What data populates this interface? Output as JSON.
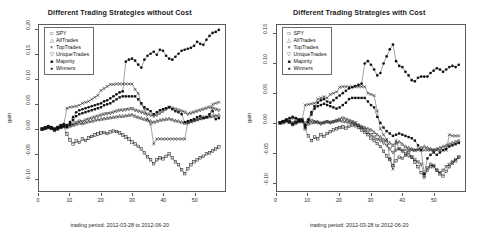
{
  "panels": [
    {
      "id": "without-cost",
      "title": "Different Trading Strategies without Cost",
      "xlabel": "trading period: 2012-03-28 to 2012-06-20",
      "ylabel": "gain"
    },
    {
      "id": "with-cost",
      "title": "Different Trading Strategies with Cost",
      "xlabel": "trading period: 2012-03-28 to 2012-06-20",
      "ylabel": "gain"
    }
  ],
  "legend": {
    "items": [
      {
        "label": "SPY",
        "symbol": "square-open-marker",
        "glyph": "□"
      },
      {
        "label": "AllTrades",
        "symbol": "triangle-up-marker",
        "glyph": "△"
      },
      {
        "label": "TopTrades",
        "symbol": "cross-x-marker",
        "glyph": "×"
      },
      {
        "label": "UniqueTrades",
        "symbol": "triangle-down-marker",
        "glyph": "▽"
      },
      {
        "label": "Majority",
        "symbol": "square-filled-marker",
        "glyph": "■"
      },
      {
        "label": "Winners",
        "symbol": "circle-filled-marker",
        "glyph": "●"
      }
    ]
  },
  "chart_data": [
    {
      "type": "scatter",
      "panel": "without-cost",
      "title": "Different Trading Strategies without Cost",
      "xlabel": "trading period: 2012-03-28 to 2012-06-20",
      "ylabel": "gain",
      "xlim": [
        0,
        60
      ],
      "ylim": [
        -0.125,
        0.21
      ],
      "grid": false,
      "legend_position": "top-left",
      "xticks": [
        0,
        10,
        20,
        30,
        40,
        50
      ],
      "yticks": [
        -0.1,
        -0.05,
        0.0,
        0.05,
        0.1,
        0.15,
        0.2
      ],
      "ytick_labels": [
        "-0.10",
        "-0.05",
        "0.00",
        "0.05",
        "0.10",
        "0.15",
        "0.20"
      ],
      "x": [
        1,
        2,
        3,
        4,
        5,
        6,
        7,
        8,
        9,
        10,
        11,
        12,
        13,
        14,
        15,
        16,
        17,
        18,
        19,
        20,
        21,
        22,
        23,
        24,
        25,
        26,
        27,
        28,
        29,
        30,
        31,
        32,
        33,
        34,
        35,
        36,
        37,
        38,
        39,
        40,
        41,
        42,
        43,
        44,
        45,
        46,
        47,
        48,
        49,
        50,
        51,
        52,
        53,
        54,
        55,
        56,
        57,
        58
      ],
      "series": [
        {
          "name": "SPY",
          "marker": "square-open-marker",
          "values": [
            0.0,
            0.002,
            0.004,
            0.001,
            -0.003,
            0.0,
            0.003,
            0.005,
            -0.01,
            -0.022,
            -0.03,
            -0.024,
            -0.027,
            -0.02,
            -0.023,
            -0.018,
            -0.015,
            -0.012,
            -0.01,
            -0.008,
            -0.007,
            -0.009,
            -0.006,
            -0.004,
            -0.005,
            -0.008,
            -0.012,
            -0.016,
            -0.02,
            -0.026,
            -0.03,
            -0.035,
            -0.04,
            -0.048,
            -0.056,
            -0.062,
            -0.07,
            -0.062,
            -0.058,
            -0.06,
            -0.055,
            -0.05,
            -0.058,
            -0.066,
            -0.072,
            -0.082,
            -0.09,
            -0.08,
            -0.072,
            -0.066,
            -0.062,
            -0.058,
            -0.055,
            -0.05,
            -0.048,
            -0.044,
            -0.04,
            -0.036
          ]
        },
        {
          "name": "AllTrades",
          "marker": "triangle-up-marker",
          "values": [
            0.0,
            0.001,
            0.003,
            0.002,
            0.0,
            0.002,
            0.004,
            0.006,
            0.004,
            0.006,
            0.008,
            0.01,
            0.012,
            0.011,
            0.013,
            0.015,
            0.016,
            0.018,
            0.019,
            0.02,
            0.021,
            0.022,
            0.023,
            0.024,
            0.025,
            0.026,
            0.026,
            0.027,
            0.028,
            0.029,
            0.026,
            0.024,
            0.022,
            0.02,
            0.018,
            0.016,
            0.014,
            0.016,
            0.018,
            0.019,
            0.02,
            0.021,
            0.019,
            0.017,
            0.016,
            0.014,
            0.012,
            0.014,
            0.016,
            0.018,
            0.02,
            0.022,
            0.024,
            0.024,
            0.025,
            0.026,
            0.027,
            0.028
          ]
        },
        {
          "name": "TopTrades",
          "marker": "cross-x-marker",
          "values": [
            0.0,
            0.002,
            0.004,
            0.003,
            0.001,
            0.003,
            0.006,
            0.008,
            0.042,
            0.044,
            0.045,
            0.046,
            0.048,
            0.052,
            0.054,
            0.056,
            0.06,
            0.064,
            0.068,
            0.078,
            0.082,
            0.086,
            0.09,
            0.09,
            0.091,
            0.091,
            0.091,
            0.091,
            0.091,
            0.091,
            0.08,
            0.072,
            0.05,
            0.04,
            0.02,
            0.01,
            -0.03,
            -0.02,
            -0.02,
            -0.02,
            -0.02,
            -0.02,
            -0.02,
            -0.02,
            -0.02,
            -0.02,
            -0.02,
            0.012,
            0.014,
            0.016,
            0.018,
            0.02,
            0.022,
            0.024,
            0.026,
            0.05,
            0.052,
            0.054
          ]
        },
        {
          "name": "UniqueTrades",
          "marker": "triangle-down-marker",
          "values": [
            0.0,
            0.002,
            0.004,
            0.002,
            0.0,
            0.003,
            0.005,
            0.007,
            0.006,
            0.008,
            0.01,
            0.013,
            0.016,
            0.015,
            0.018,
            0.02,
            0.022,
            0.024,
            0.026,
            0.028,
            0.03,
            0.031,
            0.032,
            0.034,
            0.036,
            0.038,
            0.038,
            0.039,
            0.04,
            0.041,
            0.038,
            0.036,
            0.034,
            0.032,
            0.03,
            0.028,
            0.026,
            0.028,
            0.032,
            0.036,
            0.04,
            0.044,
            0.042,
            0.04,
            0.038,
            0.036,
            0.034,
            0.03,
            0.032,
            0.034,
            0.036,
            0.038,
            0.04,
            0.042,
            0.044,
            0.042,
            0.04,
            0.038
          ]
        },
        {
          "name": "Majority",
          "marker": "square-filled-marker",
          "values": [
            0.0,
            0.002,
            0.004,
            0.002,
            -0.002,
            0.001,
            0.004,
            0.006,
            0.004,
            0.01,
            0.018,
            0.026,
            0.03,
            0.032,
            0.034,
            0.036,
            0.038,
            0.04,
            0.042,
            0.044,
            0.048,
            0.05,
            0.052,
            0.056,
            0.06,
            0.064,
            0.066,
            0.066,
            0.066,
            0.066,
            0.066,
            0.06,
            0.052,
            0.044,
            0.04,
            0.036,
            0.03,
            0.034,
            0.038,
            0.04,
            0.042,
            0.044,
            0.04,
            0.036,
            0.034,
            0.03,
            0.014,
            0.016,
            0.018,
            0.02,
            0.024,
            0.026,
            0.022,
            0.024,
            0.03,
            0.036,
            0.02,
            0.022
          ]
        },
        {
          "name": "Winners",
          "marker": "circle-filled-marker",
          "values": [
            0.0,
            0.003,
            0.006,
            0.004,
            0.0,
            0.004,
            0.008,
            0.01,
            0.008,
            0.014,
            0.024,
            0.034,
            0.038,
            0.04,
            0.042,
            0.044,
            0.046,
            0.048,
            0.05,
            0.052,
            0.056,
            0.058,
            0.062,
            0.066,
            0.07,
            0.074,
            0.076,
            0.136,
            0.14,
            0.142,
            0.138,
            0.13,
            0.124,
            0.14,
            0.148,
            0.152,
            0.156,
            0.15,
            0.16,
            0.158,
            0.148,
            0.142,
            0.14,
            0.146,
            0.152,
            0.158,
            0.16,
            0.162,
            0.164,
            0.168,
            0.176,
            0.172,
            0.17,
            0.18,
            0.188,
            0.194,
            0.196,
            0.2
          ]
        }
      ]
    },
    {
      "type": "scatter",
      "panel": "with-cost",
      "title": "Different Trading Strategies with Cost",
      "xlabel": "trading period: 2012-03-28 to 2012-06-20",
      "ylabel": "gain",
      "xlim": [
        0,
        60
      ],
      "ylim": [
        -0.115,
        0.165
      ],
      "grid": false,
      "legend_position": "top-left",
      "xticks": [
        0,
        10,
        20,
        30,
        40,
        50
      ],
      "yticks": [
        -0.1,
        -0.05,
        0.0,
        0.05,
        0.1,
        0.15
      ],
      "ytick_labels": [
        "-0.10",
        "-0.05",
        "0.00",
        "0.05",
        "0.10",
        "0.15"
      ],
      "x": [
        1,
        2,
        3,
        4,
        5,
        6,
        7,
        8,
        9,
        10,
        11,
        12,
        13,
        14,
        15,
        16,
        17,
        18,
        19,
        20,
        21,
        22,
        23,
        24,
        25,
        26,
        27,
        28,
        29,
        30,
        31,
        32,
        33,
        34,
        35,
        36,
        37,
        38,
        39,
        40,
        41,
        42,
        43,
        44,
        45,
        46,
        47,
        48,
        49,
        50,
        51,
        52,
        53,
        54,
        55,
        56,
        57,
        58
      ],
      "series": [
        {
          "name": "SPY",
          "marker": "square-open-marker",
          "values": [
            0.0,
            0.002,
            0.004,
            0.001,
            -0.003,
            0.0,
            0.003,
            0.005,
            -0.01,
            -0.022,
            -0.03,
            -0.024,
            -0.027,
            -0.02,
            -0.023,
            -0.018,
            -0.015,
            -0.012,
            -0.01,
            -0.008,
            -0.007,
            -0.009,
            -0.006,
            -0.004,
            -0.005,
            -0.008,
            -0.012,
            -0.016,
            -0.02,
            -0.026,
            -0.03,
            -0.035,
            -0.04,
            -0.048,
            -0.056,
            -0.062,
            -0.072,
            -0.064,
            -0.058,
            -0.06,
            -0.055,
            -0.05,
            -0.058,
            -0.066,
            -0.074,
            -0.084,
            -0.092,
            -0.08,
            -0.074,
            -0.072,
            -0.08,
            -0.086,
            -0.09,
            -0.082,
            -0.074,
            -0.068,
            -0.064,
            -0.058
          ]
        },
        {
          "name": "AllTrades",
          "marker": "triangle-up-marker",
          "values": [
            0.0,
            0.0,
            0.002,
            0.001,
            -0.002,
            0.0,
            0.002,
            0.003,
            -0.004,
            -0.002,
            0.0,
            0.001,
            0.002,
            0.0,
            0.001,
            0.002,
            0.001,
            0.002,
            0.003,
            0.004,
            0.003,
            0.002,
            0.001,
            0.0,
            -0.002,
            -0.004,
            -0.006,
            -0.008,
            -0.01,
            -0.012,
            -0.016,
            -0.02,
            -0.024,
            -0.028,
            -0.03,
            -0.034,
            -0.038,
            -0.034,
            -0.032,
            -0.036,
            -0.04,
            -0.042,
            -0.044,
            -0.046,
            -0.044,
            -0.042,
            -0.04,
            -0.042,
            -0.044,
            -0.046,
            -0.044,
            -0.042,
            -0.04,
            -0.038,
            -0.036,
            -0.034,
            -0.032,
            -0.03
          ]
        },
        {
          "name": "TopTrades",
          "marker": "cross-x-marker",
          "values": [
            0.0,
            0.002,
            0.004,
            0.003,
            0.001,
            0.002,
            0.005,
            0.006,
            0.03,
            0.031,
            0.032,
            0.033,
            0.04,
            0.042,
            0.044,
            0.042,
            0.048,
            0.05,
            0.052,
            0.06,
            0.061,
            0.061,
            0.061,
            0.061,
            0.061,
            0.061,
            0.061,
            0.061,
            0.05,
            0.048,
            0.046,
            0.02,
            -0.01,
            -0.02,
            -0.028,
            -0.06,
            -0.078,
            -0.03,
            -0.044,
            -0.046,
            -0.046,
            -0.046,
            -0.046,
            -0.046,
            -0.046,
            -0.046,
            -0.046,
            -0.046,
            -0.046,
            -0.046,
            -0.046,
            -0.046,
            -0.046,
            -0.046,
            -0.02,
            -0.022,
            -0.022,
            -0.022
          ]
        },
        {
          "name": "UniqueTrades",
          "marker": "triangle-down-marker",
          "values": [
            0.0,
            0.002,
            0.004,
            0.006,
            0.008,
            0.006,
            0.004,
            0.002,
            0.0,
            0.002,
            0.004,
            0.002,
            0.0,
            -0.002,
            0.0,
            0.002,
            0.0,
            0.002,
            0.004,
            0.006,
            0.008,
            0.006,
            0.004,
            0.002,
            0.0,
            -0.004,
            -0.008,
            -0.012,
            -0.016,
            -0.02,
            -0.024,
            -0.028,
            -0.03,
            -0.034,
            -0.038,
            -0.044,
            -0.05,
            -0.046,
            -0.044,
            -0.048,
            -0.052,
            -0.056,
            -0.058,
            -0.062,
            -0.066,
            -0.07,
            -0.088,
            -0.076,
            -0.07,
            -0.074,
            -0.08,
            -0.084,
            -0.08,
            -0.074,
            -0.07,
            -0.066,
            -0.062,
            -0.058
          ]
        },
        {
          "name": "Majority",
          "marker": "square-filled-marker",
          "values": [
            0.0,
            0.002,
            0.004,
            0.002,
            -0.002,
            0.001,
            0.003,
            0.004,
            -0.008,
            0.002,
            0.014,
            0.024,
            0.028,
            0.03,
            0.032,
            0.03,
            0.028,
            0.026,
            0.024,
            0.026,
            0.03,
            0.034,
            0.04,
            0.042,
            0.042,
            0.042,
            0.042,
            0.042,
            0.036,
            0.03,
            0.026,
            0.01,
            0.0,
            -0.008,
            -0.014,
            -0.018,
            -0.022,
            -0.02,
            -0.018,
            -0.02,
            -0.022,
            -0.024,
            -0.026,
            -0.03,
            -0.038,
            -0.046,
            -0.086,
            -0.06,
            -0.054,
            -0.05,
            -0.054,
            -0.05,
            -0.046,
            -0.044,
            -0.04,
            -0.038,
            -0.036,
            -0.034
          ]
        },
        {
          "name": "Winners",
          "marker": "circle-filled-marker",
          "values": [
            0.0,
            0.003,
            0.006,
            0.008,
            0.01,
            0.008,
            0.006,
            0.004,
            -0.004,
            0.006,
            0.018,
            0.028,
            0.034,
            0.038,
            0.04,
            0.036,
            0.034,
            0.038,
            0.042,
            0.046,
            0.05,
            0.054,
            0.058,
            0.06,
            0.062,
            0.064,
            0.066,
            0.1,
            0.104,
            0.098,
            0.09,
            0.08,
            0.084,
            0.1,
            0.112,
            0.124,
            0.132,
            0.104,
            0.096,
            0.094,
            0.086,
            0.08,
            0.072,
            0.07,
            0.076,
            0.078,
            0.078,
            0.078,
            0.084,
            0.088,
            0.092,
            0.09,
            0.086,
            0.09,
            0.094,
            0.096,
            0.094,
            0.098
          ]
        }
      ]
    }
  ]
}
